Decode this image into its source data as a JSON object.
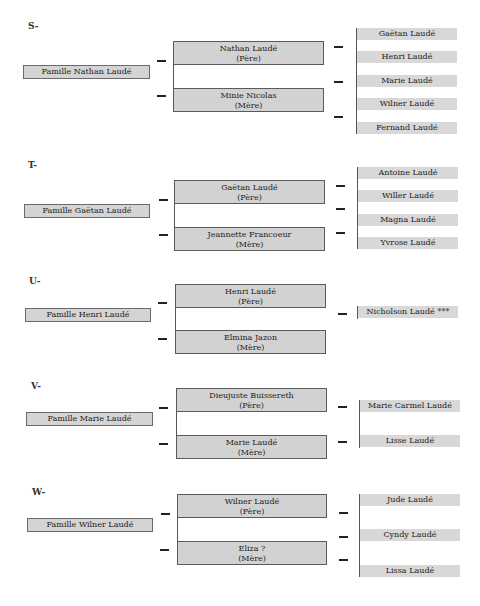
{
  "families": [
    {
      "label": "S-",
      "family": "Famille Nathan Laudé",
      "father": {
        "name": "Nathan Laudé",
        "role": "(Père)"
      },
      "mother": {
        "name": "Minie Nicolas",
        "role": "(Mère)"
      },
      "children": [
        "Gaëtan Laudé",
        "Henri Laudé",
        "Marie Laudé",
        "Wilner Laudé",
        "Fernand Laudé"
      ]
    },
    {
      "label": "T-",
      "family": "Famille Gaëtan Laudé",
      "father": {
        "name": "Gaëtan Laudé",
        "role": "(Père)"
      },
      "mother": {
        "name": "Jeannette Francoeur",
        "role": "(Mère)"
      },
      "children": [
        "Antoine Laudé",
        "Willer Laudé",
        "Magna Laudé",
        "Yvrose Laudé"
      ]
    },
    {
      "label": "U-",
      "family": "Famille Henri Laudé",
      "father": {
        "name": "Henri Laudé",
        "role": "(Père)"
      },
      "mother": {
        "name": "Elmina Jazon",
        "role": "(Mère)"
      },
      "children": [
        "Nicholson Laudé ***"
      ]
    },
    {
      "label": "V-",
      "family": "Famille Marie Laudé",
      "father": {
        "name": "Dieujuste Buissereth",
        "role": "(Père)"
      },
      "mother": {
        "name": "Marie Laudé",
        "role": "(Mère)"
      },
      "children": [
        "Marie Carmel Laudé",
        "Lisse Laudé"
      ]
    },
    {
      "label": "W-",
      "family": "Famille Wilner Laudé",
      "father": {
        "name": "Wilner Laudé",
        "role": "(Père)"
      },
      "mother": {
        "name": "Eliza ?",
        "role": "(Mère)"
      },
      "children": [
        "Jude Laudé",
        "Cyndy Laudé",
        "Lissa Laudé"
      ]
    }
  ]
}
